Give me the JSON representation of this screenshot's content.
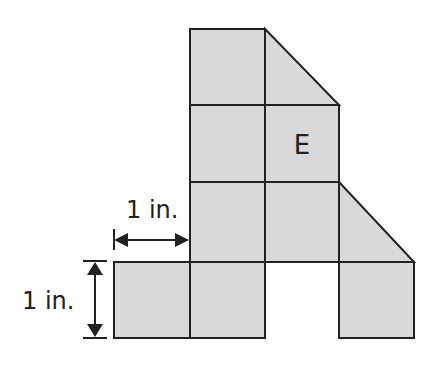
{
  "figure": {
    "fill_color": "#d9d9d9",
    "stroke_color": "#222222",
    "unit_px": 75,
    "grid": {
      "cols_x": [
        114,
        190,
        265,
        339,
        414
      ],
      "rows_y": [
        29,
        105,
        182,
        262,
        338
      ]
    },
    "squares": [
      {
        "col": 1,
        "row": 0
      },
      {
        "col": 1,
        "row": 1
      },
      {
        "col": 2,
        "row": 1
      },
      {
        "col": 1,
        "row": 2
      },
      {
        "col": 2,
        "row": 2
      },
      {
        "col": 0,
        "row": 3
      },
      {
        "col": 1,
        "row": 3
      },
      {
        "col": 3,
        "row": 3
      }
    ],
    "triangles": [
      {
        "note": "top triangle right of top square",
        "points": "265,29 339,105 265,105"
      },
      {
        "note": "triangle right of middle row",
        "points": "339,182 414,262 339,262"
      }
    ],
    "label_E": "E"
  },
  "dimensions": {
    "horizontal": {
      "label": "1 in."
    },
    "vertical": {
      "label": "1 in."
    }
  }
}
